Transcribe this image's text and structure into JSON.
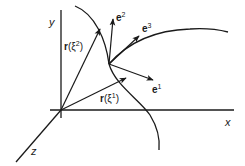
{
  "diagram": {
    "axes": {
      "x": {
        "label": "x"
      },
      "y": {
        "label": "y"
      },
      "z": {
        "label": "z"
      }
    },
    "position_vectors": [
      {
        "label_main": "r",
        "label_arg": "(ξ",
        "label_sup": "2",
        "label_close": ")"
      },
      {
        "label_main": "r",
        "label_arg": "(ξ",
        "label_sup": "1",
        "label_close": ")"
      }
    ],
    "basis_vectors": [
      {
        "label": "e",
        "sup": "1"
      },
      {
        "label": "e",
        "sup": "2"
      },
      {
        "label": "e",
        "sup": "3"
      }
    ],
    "colors": {
      "ink": "#1a1a1a",
      "background": "#ffffff"
    }
  }
}
